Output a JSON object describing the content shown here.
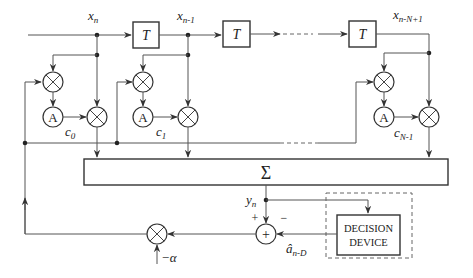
{
  "diagram": {
    "signals": {
      "x0": "x",
      "x0_sub": "n",
      "x1": "x",
      "x1_sub": "n-1",
      "xN": "x",
      "xN_sub": "n-N+1",
      "y": "y",
      "y_sub": "n",
      "ahat": "â",
      "ahat_sub": "n-D",
      "alpha": "−α"
    },
    "delay_label": "T",
    "accumulator_label": "A",
    "coefficients": [
      {
        "c": "c",
        "sub": "0"
      },
      {
        "c": "c",
        "sub": "1"
      },
      {
        "c": "c",
        "sub": "N-1"
      }
    ],
    "sum_label": "Σ",
    "adder_label": "+",
    "plus_sign": "+",
    "minus_sign": "−",
    "decision_device": {
      "line1": "DECISION",
      "line2": "DEVICE"
    }
  }
}
